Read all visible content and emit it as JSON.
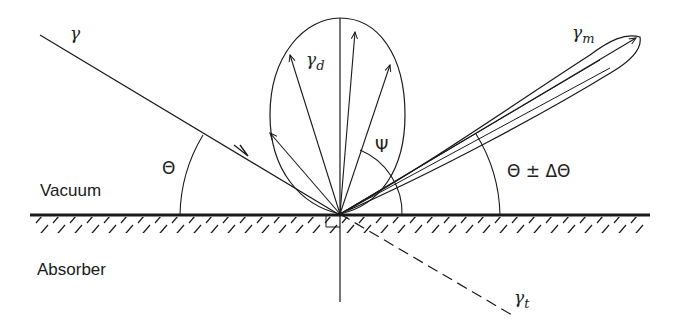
{
  "diagram": {
    "regions": {
      "upper": "Vacuum",
      "lower": "Absorber"
    },
    "rays": {
      "incident": {
        "symbol": "γ",
        "subscript": ""
      },
      "diffuse": {
        "symbol": "γ",
        "subscript": "d"
      },
      "specular": {
        "symbol": "γ",
        "subscript": "m"
      },
      "transmitted": {
        "symbol": "γ",
        "subscript": "t"
      }
    },
    "angles": {
      "incidence": "Θ",
      "scatter": "Ψ",
      "reflection": "Θ ± ΔΘ"
    },
    "colors": {
      "ink": "#1a1a1a",
      "background": "#ffffff"
    }
  }
}
